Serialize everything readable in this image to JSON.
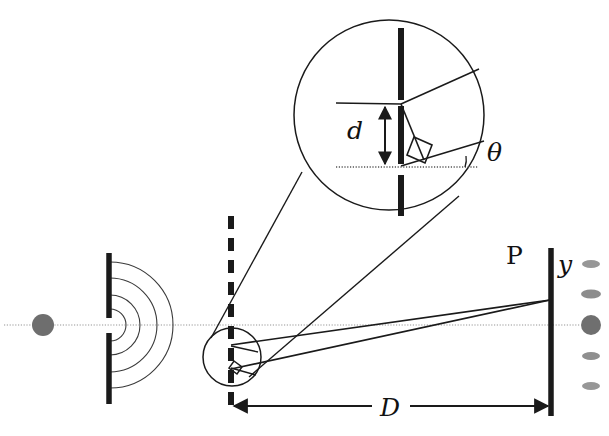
{
  "figure": {
    "domain_type": "diagram",
    "width": 609,
    "height": 436,
    "background_color": "#ffffff",
    "ink_color": "#1a1a1a",
    "thin_line_color": "#333333",
    "axis_color": "#b9b9b9",
    "source_dot_color": "#6e6e6e",
    "fringe_color": "#6f6f6f"
  },
  "labels": {
    "slit_separation": "d",
    "angle": "θ",
    "screen_distance": "D",
    "fringe_offset": "y",
    "screen_point": "P"
  },
  "elements": {
    "source_dot": "light-source-dot",
    "optical_axis": "optical-axis-line",
    "single_slit_barrier": "single-slit-barrier",
    "wavefronts": "circular-wavefronts",
    "double_slit_barrier": "double-slit-barrier-dashed",
    "magnifier_small_circle": "magnifier-source-circle",
    "magnifier_big_circle": "magnified-detail-circle",
    "magnifier_connector_lines": "magnifier-connector-lines",
    "ray_upper": "ray-from-upper-slit",
    "ray_lower": "ray-from-lower-slit",
    "screen": "observation-screen",
    "distance_arrow": "distance-D-double-arrow",
    "fringe_pattern": "interference-fringe-pattern",
    "right_angle_small": "right-angle-marker-small",
    "right_angle_big": "right-angle-marker-magnified",
    "d_dimension_arrow": "slit-separation-arrow",
    "theta_angle_arc": "theta-angle-marker"
  },
  "geometry": {
    "source_dot": {
      "cx": 43,
      "cy": 325,
      "r": 11
    },
    "optical_axis": {
      "x1": 4,
      "y1": 325,
      "x2": 580,
      "y2": 325
    },
    "single_slit": {
      "x": 109,
      "top_y1": 253,
      "top_y2": 318,
      "bot_y1": 333,
      "bot_y2": 404
    },
    "double_slit_line": {
      "x": 231,
      "y_top": 216,
      "y_bottom": 412
    },
    "small_circle": {
      "cx": 232,
      "cy": 357,
      "r": 29
    },
    "big_circle": {
      "cx": 389,
      "cy": 115,
      "r": 95
    },
    "screen": {
      "x": 551,
      "y_top": 248,
      "y_bottom": 416
    },
    "converge_point": {
      "x": 550,
      "y": 300
    },
    "slit_upper": {
      "x": 231,
      "y": 345
    },
    "slit_lower": {
      "x": 231,
      "y": 367
    },
    "distance_arrow": {
      "y": 406,
      "x_left": 231,
      "x_right": 551
    },
    "fringes_x": 591,
    "fringes_y": [
      264,
      294,
      325,
      356,
      386
    ]
  },
  "fringe_pattern": {
    "count": 5,
    "orders": [
      "m=+2",
      "m=+1",
      "m=0",
      "m=-1",
      "m=-2"
    ],
    "sizes": [
      {
        "rx": 9,
        "ry": 4,
        "opacity": 0.72
      },
      {
        "rx": 10,
        "ry": 4.5,
        "opacity": 0.8
      },
      {
        "rx": 10,
        "ry": 10,
        "opacity": 1.0
      },
      {
        "rx": 9,
        "ry": 4,
        "opacity": 0.78
      },
      {
        "rx": 9,
        "ry": 4,
        "opacity": 0.72
      }
    ]
  },
  "wavefronts": {
    "count": 4,
    "radii": [
      16,
      30,
      47,
      63
    ],
    "center": {
      "cx": 110,
      "cy": 325
    }
  }
}
